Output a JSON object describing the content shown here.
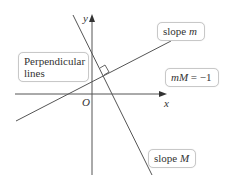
{
  "diagram": {
    "axes": {
      "x_label": "x",
      "y_label": "y",
      "origin_label": "O"
    },
    "lines": [
      {
        "name": "line-m",
        "slope_label": "m",
        "description": "positive slope line"
      },
      {
        "name": "line-M",
        "slope_label": "M",
        "description": "steep negative slope line"
      }
    ],
    "callouts": {
      "perpendicular_line1": "Perpendicular",
      "perpendicular_line2": "lines",
      "slope_m_prefix": "slope ",
      "slope_m_var": "m",
      "slope_M_prefix": "slope ",
      "slope_M_var": "M",
      "relation_lhs": "mM",
      "relation_rhs": " = −1"
    },
    "colors": {
      "line": "#555555",
      "box_border": "#c8c8c8",
      "text": "#333333"
    }
  }
}
